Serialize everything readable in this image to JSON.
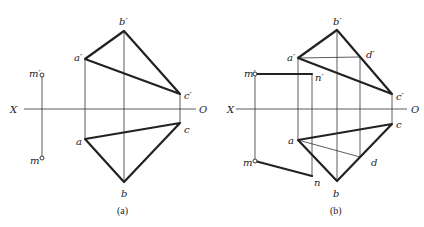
{
  "figure": {
    "panels": [
      {
        "caption": "(a)",
        "axis": {
          "left_label": "X",
          "right_label": "O"
        },
        "labels": {
          "b_prime": "b′",
          "a_prime": "a′",
          "c_prime": "c′",
          "a": "a",
          "b": "b",
          "c": "c",
          "m_prime": "m′",
          "m": "m"
        }
      },
      {
        "caption": "(b)",
        "axis": {
          "left_label": "X",
          "right_label": "O"
        },
        "labels": {
          "b_prime": "b′",
          "a_prime": "a′",
          "c_prime": "c′",
          "d_prime": "d′",
          "a": "a",
          "b": "b",
          "c": "c",
          "d": "d",
          "m_prime": "m′",
          "m": "m",
          "n_prime": "n′",
          "n": "n"
        }
      }
    ]
  }
}
